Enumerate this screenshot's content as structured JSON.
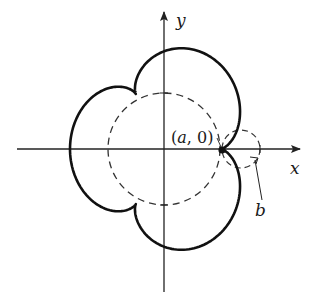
{
  "figure": {
    "axes": {
      "x_label": "x",
      "y_label": "y",
      "origin_px": [
        164,
        149
      ],
      "x_axis_from": 17,
      "x_axis_to": 300,
      "y_axis_from": 292,
      "y_axis_to": 12
    },
    "fixed_circle": {
      "radius_px": 56,
      "style": "dashed"
    },
    "rolling_circle": {
      "center_px": [
        241,
        149
      ],
      "radius_px": 19,
      "style": "dashed"
    },
    "curve": {
      "type": "epicycloid",
      "cusps": 3,
      "bx_px": 18.8,
      "by_px": 21.2,
      "stroke": "#111111"
    },
    "point": {
      "label": "(a, 0)",
      "label_a": "a",
      "label_rest": ", 0)",
      "label_open": "(",
      "position_px": [
        222,
        150
      ]
    },
    "b_label": {
      "text": "b"
    },
    "colors": {
      "stroke": "#111111",
      "axis": "#222222",
      "dashed": "#333333",
      "background": "#ffffff"
    }
  }
}
